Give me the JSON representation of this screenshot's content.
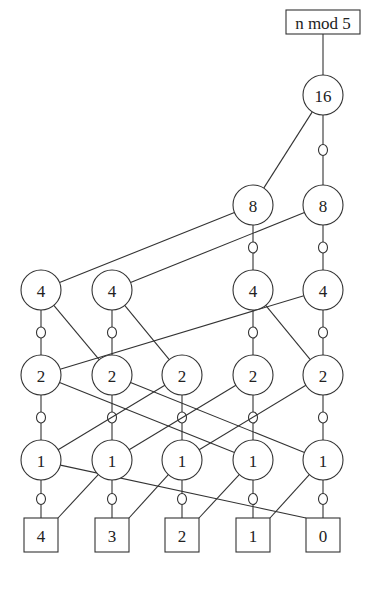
{
  "diagram": {
    "title_box": {
      "label": "n mod 5"
    },
    "root": {
      "label": "16"
    },
    "levels": [
      {
        "name": "level-8",
        "labels": [
          "",
          "",
          "",
          "8",
          "8"
        ]
      },
      {
        "name": "level-4",
        "labels": [
          "4",
          "4",
          "",
          "4",
          "4"
        ]
      },
      {
        "name": "level-2",
        "labels": [
          "2",
          "2",
          "2",
          "2",
          "2"
        ]
      },
      {
        "name": "level-1",
        "labels": [
          "1",
          "1",
          "1",
          "1",
          "1"
        ]
      }
    ],
    "outputs": [
      {
        "label": "4"
      },
      {
        "label": "3"
      },
      {
        "label": "2"
      },
      {
        "label": "1"
      },
      {
        "label": "0"
      }
    ],
    "edge_legend": {
      "plain": "then-edge (solid line)",
      "negated": "else-edge (line with small circle)"
    }
  }
}
